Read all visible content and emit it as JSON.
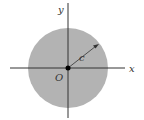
{
  "diagram": {
    "labels": {
      "y_axis": "y",
      "x_axis": "x",
      "origin": "O",
      "radius": "c"
    },
    "colors": {
      "disk_fill": "#b3b3b3",
      "axis": "#333333",
      "text": "#333333"
    }
  }
}
